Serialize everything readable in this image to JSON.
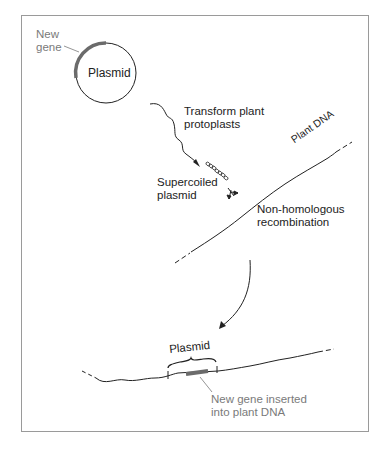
{
  "diagram": {
    "title": "",
    "labels": {
      "new_gene": [
        "New",
        "gene"
      ],
      "plasmid_circle": "Plasmid",
      "transform": [
        "Transform plant",
        "protoplasts"
      ],
      "supercoiled": [
        "Supercoiled",
        "plasmid"
      ],
      "plant_dna": "Plant DNA",
      "recombination": [
        "Non-homologous",
        "recombination"
      ],
      "plasmid_bracket": "Plasmid",
      "inserted": [
        "New gene inserted",
        "into plant DNA"
      ]
    },
    "colors": {
      "line": "#222222",
      "gene": "#6b6b6b",
      "label_gray": "#7a7a7a",
      "border": "#9a9a9a"
    },
    "nodes": [
      {
        "id": "plasmid",
        "label": "Plasmid"
      },
      {
        "id": "supercoiled",
        "label": "Supercoiled plasmid"
      },
      {
        "id": "plant-dna",
        "label": "Plant DNA"
      },
      {
        "id": "result",
        "label": "New gene inserted into plant DNA"
      }
    ],
    "edges": [
      {
        "from": "plasmid",
        "to": "supercoiled",
        "label": "Transform plant protoplasts"
      },
      {
        "from": "plant-dna",
        "to": "result",
        "label": "Non-homologous recombination"
      }
    ]
  }
}
